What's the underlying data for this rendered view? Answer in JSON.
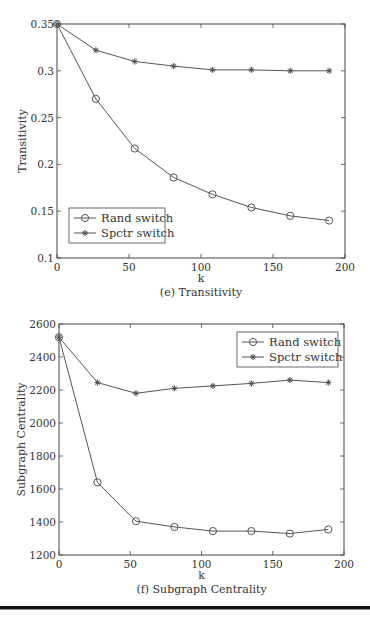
{
  "chart_data": [
    {
      "type": "line",
      "title": "(e) Transitivity",
      "xlabel": "k",
      "ylabel": "Transitivity",
      "xlim": [
        0,
        200
      ],
      "ylim": [
        0.1,
        0.35
      ],
      "xticks": [
        0,
        50,
        100,
        150,
        200
      ],
      "yticks": [
        0.1,
        0.15,
        0.2,
        0.25,
        0.3,
        0.35
      ],
      "ytick_labels": [
        "0.1",
        "0.15",
        "0.2",
        "0.25",
        "0.3",
        "0.35"
      ],
      "grid": false,
      "legend_position": "lower left",
      "x": [
        0,
        27,
        54,
        81,
        108,
        135,
        162,
        189
      ],
      "series": [
        {
          "name": "Rand switch",
          "marker": "circle",
          "values": [
            0.35,
            0.27,
            0.217,
            0.186,
            0.168,
            0.154,
            0.145,
            0.14
          ]
        },
        {
          "name": "Spctr switch",
          "marker": "star",
          "values": [
            0.35,
            0.322,
            0.31,
            0.305,
            0.301,
            0.301,
            0.3,
            0.3
          ]
        }
      ]
    },
    {
      "type": "line",
      "title": "(f) Subgraph Centrality",
      "xlabel": "k",
      "ylabel": "Subgraph Centrality",
      "xlim": [
        0,
        200
      ],
      "ylim": [
        1200,
        2600
      ],
      "xticks": [
        0,
        50,
        100,
        150,
        200
      ],
      "yticks": [
        1200,
        1400,
        1600,
        1800,
        2000,
        2200,
        2400,
        2600
      ],
      "ytick_labels": [
        "1200",
        "1400",
        "1600",
        "1800",
        "2000",
        "2200",
        "2400",
        "2600"
      ],
      "grid": false,
      "legend_position": "upper right",
      "x": [
        0,
        27,
        54,
        81,
        108,
        135,
        162,
        189
      ],
      "series": [
        {
          "name": "Rand switch",
          "marker": "circle",
          "values": [
            2520,
            1640,
            1405,
            1370,
            1345,
            1345,
            1330,
            1355
          ]
        },
        {
          "name": "Spctr switch",
          "marker": "star",
          "values": [
            2520,
            2245,
            2180,
            2210,
            2225,
            2240,
            2260,
            2245
          ]
        }
      ]
    }
  ],
  "colors": {
    "line": "#555555",
    "axis": "#444444",
    "rule": "#111111"
  }
}
